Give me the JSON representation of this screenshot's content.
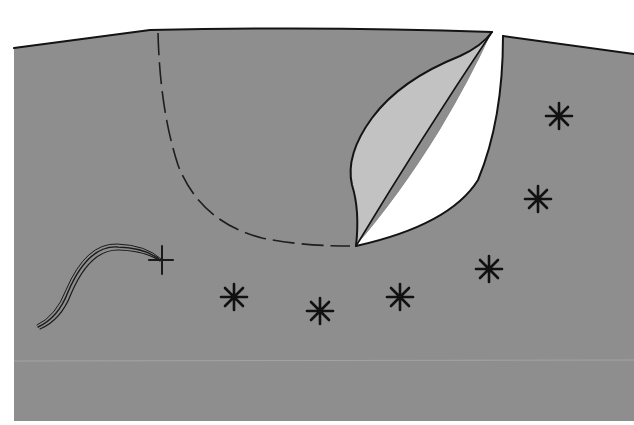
{
  "diagram": {
    "subject": "fabric with bound slit opening and facing, dashed stitching guide, decorative star stitches and thread with starting cross stitch",
    "colors": {
      "background": "#ffffff",
      "fabric": "#8e8e8e",
      "facing": "#c2c2c2",
      "opening": "#ffffff",
      "outline": "#141414",
      "fold_line": "#a4a4a4"
    },
    "elements": {
      "fabric_panel": {
        "label": "fabric-panel"
      },
      "slit_opening": {
        "label": "slit-opening"
      },
      "facing_flap": {
        "label": "facing-flap"
      },
      "stitch_guide": {
        "label": "dashed-stitching-line",
        "style": "dashed"
      },
      "thread": {
        "label": "thread-with-cross-stitch"
      },
      "star_stitches": [
        {
          "x": 559,
          "y": 116
        },
        {
          "x": 538,
          "y": 199
        },
        {
          "x": 489,
          "y": 269
        },
        {
          "x": 400,
          "y": 297
        },
        {
          "x": 320,
          "y": 311
        },
        {
          "x": 234,
          "y": 297
        }
      ],
      "cross_stitch": {
        "x": 161,
        "y": 260
      }
    }
  }
}
